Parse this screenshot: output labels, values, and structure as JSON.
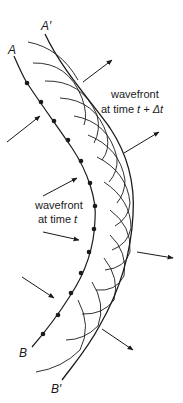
{
  "diagram": {
    "colors": {
      "ink": "#1a1a1a",
      "background": "#ffffff"
    },
    "labels": {
      "point_A": "A",
      "point_A_prime": "A′",
      "point_B": "B",
      "point_B_prime": "B′",
      "wavefront_t_line1": "wavefront",
      "wavefront_t_line2_prefix": "at time ",
      "wavefront_t_var": "t",
      "wavefront_tdt_line1": "wavefront",
      "wavefront_tdt_line2_prefix": "at time ",
      "wavefront_tdt_var": "t + Δt"
    },
    "inner_wavefront": {
      "name": "wavefront at time t",
      "endpoints": [
        "A",
        "B"
      ],
      "source_points": [
        [
          27,
          83
        ],
        [
          41,
          102
        ],
        [
          54,
          121
        ],
        [
          68,
          140
        ],
        [
          81,
          161
        ],
        [
          90,
          183
        ],
        [
          95,
          206
        ],
        [
          94,
          228
        ],
        [
          89,
          252
        ],
        [
          81,
          273
        ],
        [
          71,
          293
        ],
        [
          58,
          315
        ],
        [
          43,
          334
        ]
      ]
    },
    "outer_wavefront": {
      "name": "wavefront at time t + Δt",
      "endpoints": [
        "A′",
        "B′"
      ]
    },
    "incoming_arrows": 4,
    "outgoing_arrows": 4,
    "wavelet_count": 13
  }
}
